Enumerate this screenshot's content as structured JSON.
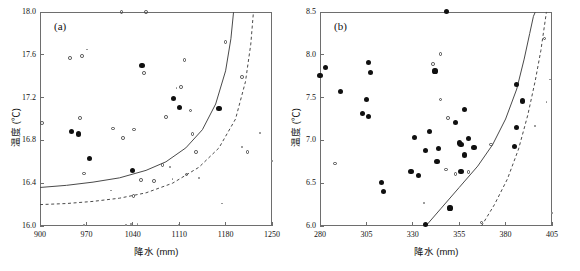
{
  "figure": {
    "background": "#ffffff",
    "width": 580,
    "height": 271
  },
  "chart_data": [
    {
      "type": "scatter",
      "panel_label": "(a)",
      "title": "",
      "xlabel": "降水 (mm)",
      "ylabel": "温度 (℃)",
      "xlim": [
        900,
        1250
      ],
      "ylim": [
        16.0,
        18.0
      ],
      "xticks": [
        900,
        970,
        1040,
        1110,
        1180,
        1250
      ],
      "xtick_labels": [
        "900",
        "970",
        "1040",
        "1110",
        "1180",
        "1250"
      ],
      "yticks": [
        16.0,
        16.4,
        16.8,
        17.2,
        17.6,
        18.0
      ],
      "ytick_labels": [
        "16.0",
        "16.4",
        "16.8",
        "17.2",
        "17.6",
        "18.0"
      ],
      "grid": false,
      "legend": "none",
      "series": [
        {
          "name": "filled-circle-points",
          "marker": "filled-circle",
          "color": "#101010",
          "points": [
            [
              1054,
              17.5
            ],
            [
              1101,
              17.19
            ],
            [
              1110,
              17.11
            ],
            [
              1170,
              17.1
            ],
            [
              948,
              16.88
            ],
            [
              958,
              16.86
            ],
            [
              975,
              16.63
            ],
            [
              1040,
              16.52
            ]
          ]
        },
        {
          "name": "open-circle-points",
          "marker": "open-circle",
          "color": "#4a4a4a",
          "points": [
            [
              1023,
              18.0
            ],
            [
              1060,
              18.0
            ],
            [
              1180,
              17.72
            ],
            [
              945,
              17.57
            ],
            [
              963,
              17.59
            ],
            [
              1118,
              17.55
            ],
            [
              1057,
              17.43
            ],
            [
              1205,
              17.39
            ],
            [
              1113,
              17.3
            ],
            [
              1127,
              17.08
            ],
            [
              903,
              16.96
            ],
            [
              960,
              17.01
            ],
            [
              1090,
              17.02
            ],
            [
              1010,
              16.91
            ],
            [
              1042,
              16.9
            ],
            [
              1130,
              16.86
            ],
            [
              1025,
              16.82
            ],
            [
              1135,
              16.69
            ],
            [
              1213,
              16.69
            ],
            [
              966,
              16.49
            ],
            [
              1085,
              16.57
            ],
            [
              1121,
              16.48
            ],
            [
              1052,
              16.43
            ],
            [
              1072,
              16.42
            ],
            [
              1041,
              16.28
            ]
          ]
        },
        {
          "name": "small-dot-points",
          "marker": "dot",
          "color": "#8a8a8a",
          "points": [
            [
              971,
              17.65
            ],
            [
              1106,
              17.29
            ],
            [
              1096,
              16.55
            ],
            [
              1007,
              16.33
            ],
            [
              1100,
              16.44
            ],
            [
              1140,
              16.45
            ],
            [
              1175,
              16.21
            ],
            [
              1232,
              16.87
            ],
            [
              1250,
              16.61
            ],
            [
              1205,
              16.74
            ],
            [
              1037,
              16.02
            ],
            [
              1047,
              16.02
            ],
            [
              966,
              16.01
            ],
            [
              1110,
              16.01
            ],
            [
              1180,
              16.01
            ],
            [
              1030,
              16.01
            ]
          ]
        }
      ],
      "curves": [
        {
          "name": "solid-threshold-curve",
          "style": "solid",
          "color": "#4a4a4a",
          "asymptote_x": 1192,
          "points": [
            [
              900,
              16.36
            ],
            [
              940,
              16.38
            ],
            [
              980,
              16.41
            ],
            [
              1020,
              16.45
            ],
            [
              1060,
              16.52
            ],
            [
              1090,
              16.6
            ],
            [
              1120,
              16.73
            ],
            [
              1145,
              16.9
            ],
            [
              1165,
              17.14
            ],
            [
              1180,
              17.45
            ],
            [
              1188,
              17.75
            ],
            [
              1192,
              18.0
            ]
          ]
        },
        {
          "name": "dashed-threshold-curve",
          "style": "dashed",
          "color": "#4a4a4a",
          "asymptote_x": 1222,
          "points": [
            [
              900,
              16.2
            ],
            [
              940,
              16.21
            ],
            [
              980,
              16.23
            ],
            [
              1020,
              16.26
            ],
            [
              1060,
              16.31
            ],
            [
              1100,
              16.4
            ],
            [
              1140,
              16.55
            ],
            [
              1170,
              16.73
            ],
            [
              1195,
              17.0
            ],
            [
              1210,
              17.35
            ],
            [
              1218,
              17.7
            ],
            [
              1222,
              18.0
            ]
          ]
        }
      ]
    },
    {
      "type": "scatter",
      "panel_label": "(b)",
      "title": "",
      "xlabel": "降水 (mm)",
      "ylabel": "温度 (℃)",
      "xlim": [
        280,
        405
      ],
      "ylim": [
        6.0,
        8.5
      ],
      "xticks": [
        280,
        305,
        330,
        355,
        380,
        405
      ],
      "xtick_labels": [
        "280",
        "305",
        "330",
        "355",
        "380",
        "405"
      ],
      "yticks": [
        6.0,
        6.5,
        7.0,
        7.5,
        8.0,
        8.5
      ],
      "ytick_labels": [
        "6.0",
        "6.5",
        "7.0",
        "7.5",
        "8.0",
        "8.5"
      ],
      "grid": false,
      "legend": "none",
      "series": [
        {
          "name": "filled-circle-points",
          "marker": "filled-circle",
          "color": "#101010",
          "points": [
            [
              348,
              8.51
            ],
            [
              306,
              7.91
            ],
            [
              283,
              7.85
            ],
            [
              280,
              7.76
            ],
            [
              307,
              7.79
            ],
            [
              342,
              7.81
            ],
            [
              291,
              7.57
            ],
            [
              305,
              7.48
            ],
            [
              386,
              7.65
            ],
            [
              389,
              7.46
            ],
            [
              303,
              7.31
            ],
            [
              306,
              7.28
            ],
            [
              358,
              7.36
            ],
            [
              353,
              7.21
            ],
            [
              386,
              7.15
            ],
            [
              339,
              7.1
            ],
            [
              331,
              7.03
            ],
            [
              360,
              7.02
            ],
            [
              355,
              6.97
            ],
            [
              356,
              6.95
            ],
            [
              363,
              6.92
            ],
            [
              385,
              6.93
            ],
            [
              344,
              6.91
            ],
            [
              337,
              6.88
            ],
            [
              358,
              6.83
            ],
            [
              343,
              6.75
            ],
            [
              329,
              6.64
            ],
            [
              356,
              6.64
            ],
            [
              333,
              6.59
            ],
            [
              313,
              6.51
            ],
            [
              314,
              6.4
            ],
            [
              350,
              6.21
            ],
            [
              337,
              6.02
            ]
          ]
        },
        {
          "name": "open-circle-points",
          "marker": "open-circle",
          "color": "#4a4a4a",
          "points": [
            [
              401,
              8.19
            ],
            [
              345,
              8.01
            ],
            [
              341,
              7.89
            ],
            [
              345,
              7.48
            ],
            [
              349,
              7.26
            ],
            [
              372,
              6.95
            ],
            [
              288,
              6.73
            ],
            [
              348,
              6.66
            ],
            [
              360,
              6.63
            ],
            [
              353,
              6.61
            ],
            [
              367,
              6.04
            ]
          ]
        },
        {
          "name": "small-dot-points",
          "marker": "dot",
          "color": "#8a8a8a",
          "points": [
            [
              404,
              7.71
            ],
            [
              402,
              7.45
            ],
            [
              396,
              7.17
            ],
            [
              336,
              6.27
            ],
            [
              405,
              6.15
            ]
          ]
        }
      ],
      "curves": [
        {
          "name": "solid-threshold-curve",
          "style": "solid",
          "color": "#4a4a4a",
          "asymptote_x": 396,
          "points": [
            [
              337,
              6.0
            ],
            [
              345,
              6.2
            ],
            [
              355,
              6.45
            ],
            [
              365,
              6.7
            ],
            [
              373,
              6.95
            ],
            [
              380,
              7.25
            ],
            [
              386,
              7.6
            ],
            [
              390,
              7.95
            ],
            [
              393,
              8.25
            ],
            [
              395,
              8.45
            ],
            [
              396,
              8.5
            ]
          ]
        },
        {
          "name": "dashed-threshold-curve",
          "style": "dashed",
          "color": "#4a4a4a",
          "asymptote_x": 402,
          "points": [
            [
              367,
              6.0
            ],
            [
              374,
              6.25
            ],
            [
              381,
              6.55
            ],
            [
              387,
              6.9
            ],
            [
              392,
              7.3
            ],
            [
              396,
              7.7
            ],
            [
              399,
              8.05
            ],
            [
              401,
              8.35
            ],
            [
              402,
              8.5
            ]
          ]
        }
      ]
    }
  ]
}
